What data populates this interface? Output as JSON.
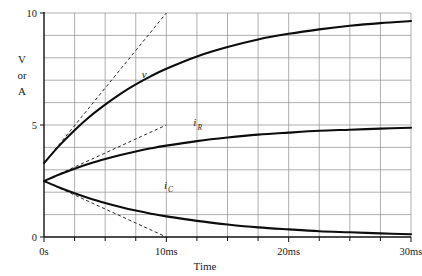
{
  "chart_data": {
    "type": "line",
    "title": "",
    "xlabel": "Time",
    "ylabel": "V or A",
    "ylabel_lines": [
      "V",
      "or",
      "A"
    ],
    "xlim": [
      0,
      30
    ],
    "ylim": [
      0,
      10
    ],
    "x_unit": "ms",
    "grid": true,
    "legend": "inline-labels",
    "x_tick_labels": [
      "0s",
      "10ms",
      "20ms",
      "30ms"
    ],
    "x_tick_values": [
      0,
      10,
      20,
      30
    ],
    "x_minor_ticks": [
      2.5,
      5,
      7.5,
      12.5,
      15,
      17.5,
      22.5,
      25,
      27.5
    ],
    "y_tick_labels": [
      "0",
      "5",
      "10"
    ],
    "y_tick_values": [
      0,
      5,
      10
    ],
    "y_gridlines": [
      1,
      2,
      3,
      4,
      5,
      6,
      7,
      8,
      9,
      10
    ],
    "time_constant_ms": 10,
    "series": [
      {
        "name": "v",
        "label": "v",
        "label_base": "v",
        "label_sub": "",
        "style": "solid",
        "initial_value": 3.3,
        "final_value": 10.0,
        "direction": "rising",
        "x": [
          0,
          1.25,
          2.5,
          3.75,
          5,
          6.25,
          7.5,
          8.75,
          10,
          12.5,
          15,
          17.5,
          20,
          22.5,
          25,
          27.5,
          30
        ],
        "values": [
          3.3,
          4.08,
          4.77,
          5.38,
          5.91,
          6.39,
          6.81,
          7.18,
          7.51,
          8.06,
          8.48,
          8.82,
          9.07,
          9.27,
          9.43,
          9.55,
          9.64
        ]
      },
      {
        "name": "i_R",
        "label": "iR",
        "label_base": "i",
        "label_sub": "R",
        "style": "solid",
        "initial_value": 2.5,
        "final_value": 5.0,
        "direction": "rising",
        "x": [
          0,
          1.25,
          2.5,
          3.75,
          5,
          6.25,
          7.5,
          8.75,
          10,
          12.5,
          15,
          17.5,
          20,
          22.5,
          25,
          27.5,
          30
        ],
        "values": [
          2.5,
          2.79,
          3.05,
          3.28,
          3.48,
          3.66,
          3.82,
          3.96,
          4.08,
          4.28,
          4.44,
          4.57,
          4.66,
          4.74,
          4.79,
          4.84,
          4.88
        ]
      },
      {
        "name": "i_C",
        "label": "iC",
        "label_base": "i",
        "label_sub": "C",
        "style": "solid",
        "initial_value": 2.5,
        "final_value": 0.0,
        "direction": "decaying",
        "x": [
          0,
          1.25,
          2.5,
          3.75,
          5,
          6.25,
          7.5,
          8.75,
          10,
          12.5,
          15,
          17.5,
          20,
          22.5,
          25,
          27.5,
          30
        ],
        "values": [
          2.5,
          2.21,
          1.95,
          1.72,
          1.52,
          1.34,
          1.18,
          1.04,
          0.92,
          0.72,
          0.56,
          0.43,
          0.34,
          0.26,
          0.21,
          0.16,
          0.12
        ]
      }
    ],
    "tangents": [
      {
        "name": "v-tangent",
        "style": "dashed",
        "x0": 0,
        "y0": 3.3,
        "x1": 10,
        "y1": 10.0
      },
      {
        "name": "iR-tangent",
        "style": "dashed",
        "x0": 0,
        "y0": 2.5,
        "x1": 10,
        "y1": 5.0
      },
      {
        "name": "iC-tangent",
        "style": "dashed",
        "x0": 0,
        "y0": 2.5,
        "x1": 10,
        "y1": 0.0
      }
    ],
    "annotations": [
      {
        "name": "v-label",
        "text": "v",
        "x": 8.0,
        "y": 7.1
      },
      {
        "name": "iR-label",
        "text": "iR",
        "x": 12.2,
        "y": 4.95
      },
      {
        "name": "iC-label",
        "text": "iC",
        "x": 9.8,
        "y": 2.15
      }
    ]
  },
  "axes": {
    "y_title_1": "V",
    "y_title_2": "or",
    "y_title_3": "A",
    "x_title": "Time",
    "y_top": "10",
    "y_mid": "5",
    "y_zero": "0",
    "x_0": "0s",
    "x_10": "10ms",
    "x_20": "20ms",
    "x_30": "30ms"
  },
  "labels": {
    "v_base": "v",
    "iR_base": "i",
    "iR_sub": "R",
    "iC_base": "i",
    "iC_sub": "C"
  },
  "colors": {
    "background": "#ffffff",
    "grid": "#8e8e8e",
    "axis": "#111111",
    "curve": "#0d0d0d",
    "tangent": "#2b2b2b",
    "text": "#1a1a1a"
  }
}
